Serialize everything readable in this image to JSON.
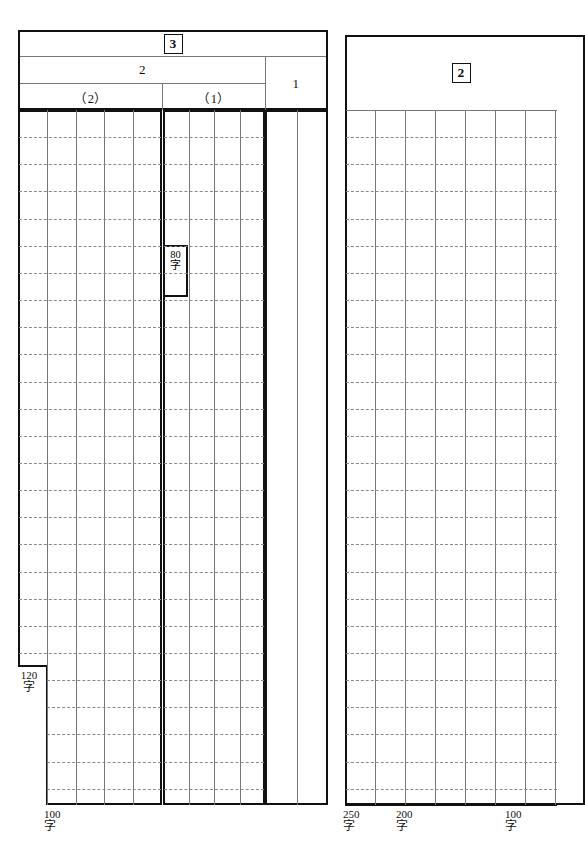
{
  "sheet": {
    "kind": "japanese-exam-answer-sheet",
    "ji_char": "字"
  },
  "left_panel": {
    "question_number": "3",
    "header_rows": {
      "section_2_label": "2",
      "section_1_label": "1",
      "sub_2_label": "（2）",
      "sub_1_label": "（1）"
    },
    "columns": {
      "sub2_count": 5,
      "sub1_count": 4,
      "sec1_count": 2
    },
    "markers": [
      {
        "name": "80-ji",
        "number": "80",
        "unit": "字"
      },
      {
        "name": "120-ji",
        "number": "120",
        "unit": "字"
      },
      {
        "name": "100-ji",
        "number": "100",
        "unit": "字"
      }
    ]
  },
  "right_panel": {
    "question_number": "2",
    "columns": {
      "count": 8
    },
    "markers": [
      {
        "name": "250-ji",
        "number": "250",
        "unit": "字"
      },
      {
        "name": "200-ji",
        "number": "200",
        "unit": "字"
      },
      {
        "name": "100-ji",
        "number": "100",
        "unit": "字"
      }
    ]
  },
  "colors": {
    "ink": "#111111",
    "rule": "#777777",
    "dotted_rule": "#8a8a8a",
    "paper": "#ffffff"
  }
}
